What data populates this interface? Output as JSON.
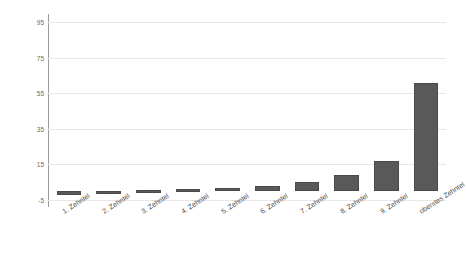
{
  "chart_data": {
    "type": "bar",
    "title": "",
    "subtitle": "",
    "xlabel": "",
    "ylabel": "",
    "categories": [
      "1. Zehntel",
      "2. Zehntel",
      "3. Zehntel",
      "4. Zehntel",
      "5. Zehntel",
      "6. Zehntel",
      "7. Zehntel",
      "8. Zehntel",
      "9. Zehntel",
      "oberstes Zehntel"
    ],
    "values": [
      -2,
      0,
      0.5,
      1,
      1.5,
      3,
      5,
      9,
      17,
      61
    ],
    "ylim": [
      -5,
      95
    ],
    "yticks": [
      95,
      75,
      55,
      35,
      15,
      -5
    ],
    "ytick_labels": [
      "95",
      "75",
      "55",
      "35",
      "15",
      "-5"
    ],
    "grid": true,
    "legend": "none",
    "series_color": "#595959",
    "gridline_color": "#e8e8e8",
    "axis_color": "#9a9a9a"
  }
}
